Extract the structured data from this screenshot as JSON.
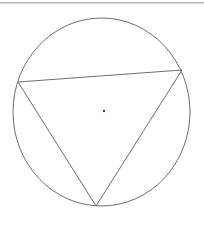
{
  "figure": {
    "canvas": {
      "width": 204,
      "height": 225,
      "background": "#ffffff"
    },
    "divider": {
      "name": "top-divider",
      "x1": 0,
      "y1": 3,
      "x2": 204,
      "y2": 3,
      "color": "#b4b4b4",
      "stroke_width": 1
    },
    "circle": {
      "label": "circle",
      "cx": 101.5,
      "cy": 112,
      "rx": 88.5,
      "ry": 94,
      "stroke": "#6e6e6e",
      "stroke_width": 1,
      "fill": "none"
    },
    "center_point": {
      "label": "center",
      "cx": 104,
      "cy": 111,
      "r": 1.2,
      "fill": "#3c3c3c"
    },
    "triangle": {
      "label": "inscribed triangle",
      "stroke": "#6e6e6e",
      "stroke_width": 1,
      "fill": "none",
      "points": "18,82 182,70 96,206",
      "vertices": [
        {
          "name": "vertex-left",
          "x": 18,
          "y": 82
        },
        {
          "name": "vertex-right",
          "x": 182,
          "y": 70
        },
        {
          "name": "vertex-bottom",
          "x": 96,
          "y": 206
        }
      ],
      "edges": [
        {
          "name": "edge-top-chord",
          "from": "vertex-left",
          "to": "vertex-right"
        },
        {
          "name": "edge-right",
          "from": "vertex-right",
          "to": "vertex-bottom"
        },
        {
          "name": "edge-left",
          "from": "vertex-left",
          "to": "vertex-bottom"
        }
      ]
    }
  },
  "chart_data": {
    "type": "scatter",
    "title": "",
    "xlabel": "",
    "ylabel": "",
    "xlim": [
      0,
      204
    ],
    "ylim": [
      0,
      225
    ],
    "grid": false,
    "legend": "none",
    "annotations": [
      "circle centered at (101.5, 112) with horizontal radius 88.5 and vertical radius 94",
      "triangle inscribed with vertices at (18, 82), (182, 70) and (96, 206)",
      "small filled dot marking the circle center at (104, 111)",
      "horizontal rule across the top of the canvas at y = 3"
    ],
    "series": [
      {
        "name": "triangle-vertices",
        "x": [
          18,
          182,
          96
        ],
        "y": [
          82,
          70,
          206
        ]
      },
      {
        "name": "center-dot",
        "x": [
          104
        ],
        "y": [
          111
        ]
      }
    ]
  }
}
